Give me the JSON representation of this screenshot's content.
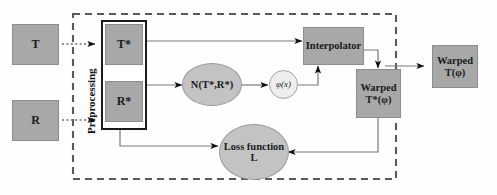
{
  "diagram": {
    "colors": {
      "gray_box": "#a8a8a8",
      "gray_ellipse": "#c3c3c3",
      "light_circle": "#ededed",
      "stroke": "#6f6f6f",
      "arrowhead": "#111111",
      "dashed_boundary": "#5a5a5a",
      "frame": "#1a1a1a"
    },
    "nodes": {
      "template_input": {
        "label": "T"
      },
      "reference_input": {
        "label": "R"
      },
      "template_star": {
        "label": "T*"
      },
      "reference_star": {
        "label": "R*"
      },
      "network": {
        "label": "N(T*,R*)"
      },
      "phi": {
        "label": "φ(x)"
      },
      "interpolator": {
        "label": "Interpolator"
      },
      "warped_star": {
        "line1": "Warped",
        "line2": "T*(φ)"
      },
      "loss": {
        "line1": "Loss function",
        "line2": "L"
      },
      "warped_out": {
        "line1": "Warped",
        "line2": "T(φ)"
      }
    },
    "group_label": {
      "line1": "Preprocessing",
      "line2": "by RKHS"
    },
    "edges": [
      {
        "name": "t-to-tstar",
        "from": "template_input",
        "to": "template_star",
        "style": "dotted"
      },
      {
        "name": "r-to-rstar",
        "from": "reference_input",
        "to": "reference_star",
        "style": "dotted"
      },
      {
        "name": "tstar-to-interpolator",
        "from": "template_star",
        "to": "interpolator",
        "style": "solid"
      },
      {
        "name": "rstar-to-network",
        "from": "reference_star",
        "to": "network",
        "style": "solid"
      },
      {
        "name": "rstar-to-loss",
        "from": "reference_star",
        "to": "loss",
        "style": "solid"
      },
      {
        "name": "network-to-phi",
        "from": "network",
        "to": "phi",
        "style": "solid"
      },
      {
        "name": "phi-to-interpolator",
        "from": "phi",
        "to": "interpolator",
        "style": "solid"
      },
      {
        "name": "interpolator-to-warped-star",
        "from": "interpolator",
        "to": "warped_star",
        "style": "solid"
      },
      {
        "name": "warped-star-to-loss",
        "from": "warped_star",
        "to": "loss",
        "style": "solid"
      },
      {
        "name": "warped-star-to-warped-out",
        "from": "warped_star",
        "to": "warped_out",
        "style": "solid"
      }
    ]
  }
}
